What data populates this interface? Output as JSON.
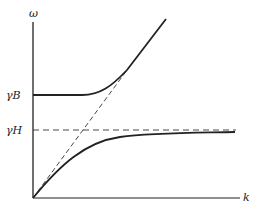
{
  "figure": {
    "axes": {
      "y_label": "ω",
      "x_label": "k"
    },
    "levels": [
      {
        "id": "gamma-B",
        "label": "γB"
      },
      {
        "id": "gamma-H",
        "label": "γH"
      }
    ],
    "curves": [
      {
        "id": "upper-branch",
        "style": "solid",
        "description": "starts at γB, flat, then rises along the light line"
      },
      {
        "id": "lower-branch",
        "style": "solid",
        "description": "starts at origin, rises, saturates toward γH"
      },
      {
        "id": "light-line",
        "style": "dashed",
        "description": "straight line from origin"
      },
      {
        "id": "gamma-H-asymptote",
        "style": "dashed",
        "description": "horizontal at γH"
      }
    ],
    "colors": {
      "ink": "#222222",
      "background": "#ffffff"
    }
  }
}
